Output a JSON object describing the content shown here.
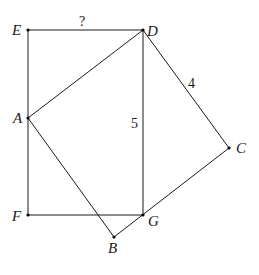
{
  "diagram": {
    "title": "",
    "points": {
      "E": {
        "label": "E",
        "x": 28,
        "y": 30
      },
      "D": {
        "label": "D",
        "x": 143,
        "y": 30
      },
      "A": {
        "label": "A",
        "x": 28,
        "y": 118
      },
      "F": {
        "label": "F",
        "x": 28,
        "y": 215
      },
      "G": {
        "label": "G",
        "x": 143,
        "y": 215
      },
      "B": {
        "label": "B",
        "x": 114,
        "y": 237
      },
      "C": {
        "label": "C",
        "x": 229,
        "y": 148
      }
    },
    "segments": [
      [
        "E",
        "D"
      ],
      [
        "E",
        "F"
      ],
      [
        "F",
        "G"
      ],
      [
        "D",
        "G"
      ],
      [
        "A",
        "D"
      ],
      [
        "D",
        "C"
      ],
      [
        "C",
        "B"
      ],
      [
        "B",
        "A"
      ]
    ],
    "measure_labels": {
      "ED": "?",
      "DC": "4",
      "DG": "5"
    }
  }
}
